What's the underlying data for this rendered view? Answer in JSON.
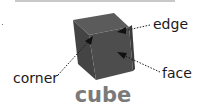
{
  "figure": {
    "title": "cube",
    "labels": {
      "edge": "edge",
      "face": "face",
      "corner": "corner"
    }
  },
  "colors": {
    "cube_front": "#4a4a4a",
    "cube_top": "#5a5a5a",
    "cube_side": "#3a3a3a",
    "title": "#7a7a7a",
    "label": "#1a1a1a",
    "leader": "#1a1a1a"
  }
}
